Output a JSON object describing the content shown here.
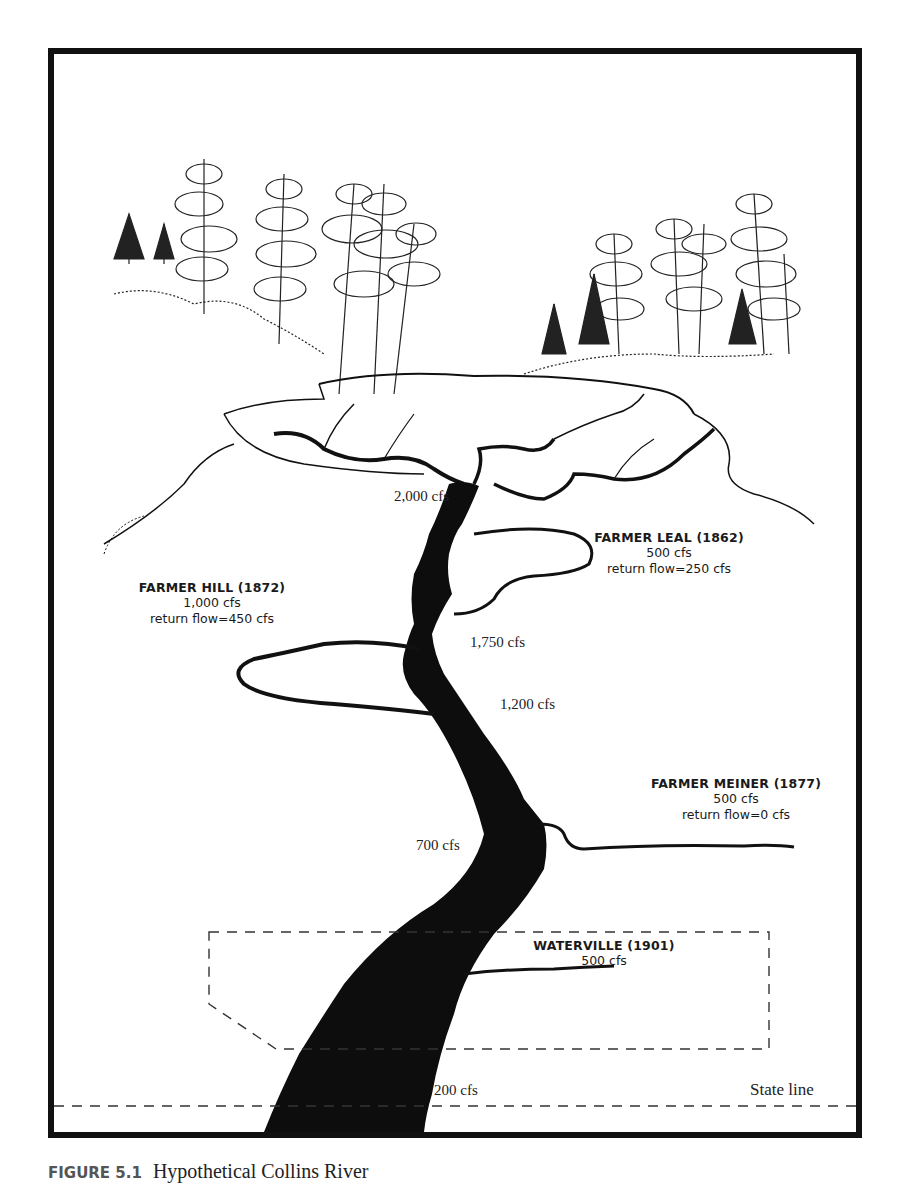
{
  "figure": {
    "title": "Hypothetical Collins River",
    "figure_number": "FIGURE 5.1"
  },
  "diverters": [
    {
      "name": "FARMER LEAL (1862)",
      "diversion": "500 cfs",
      "return_flow": "return flow=250 cfs"
    },
    {
      "name": "FARMER HILL  (1872)",
      "diversion": "1,000 cfs",
      "return_flow": "return flow=450 cfs"
    },
    {
      "name": "FARMER MEINER (1877)",
      "diversion": "500 cfs",
      "return_flow": "return flow=0 cfs"
    },
    {
      "name": "WATERVILLE (1901)",
      "diversion": "500 cfs"
    }
  ],
  "river_flows": [
    {
      "label": "2,000 cfs"
    },
    {
      "label": "1,750 cfs"
    },
    {
      "label": "1,200 cfs"
    },
    {
      "label": "700 cfs"
    },
    {
      "label": "200 cfs"
    }
  ],
  "boundary": {
    "label": "State line"
  },
  "colors": {
    "ink": "#111111",
    "paper": "#ffffff"
  }
}
